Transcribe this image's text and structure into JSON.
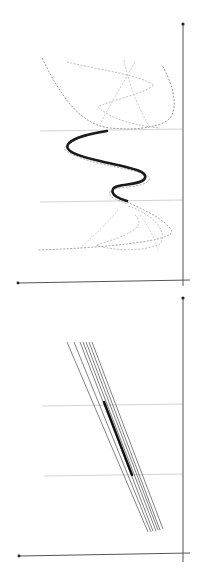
{
  "figure": {
    "background": "#ffffff",
    "panels": [
      {
        "id": "top-panel",
        "axis_color": "#555555",
        "grid_color": "#c8c8c8",
        "vertical_axis": {
          "x": 183,
          "y1": 24,
          "y2": 286
        },
        "horizontal_axis": {
          "x1": 18,
          "y1": 283,
          "x2": 190,
          "y2": 280
        },
        "gridlines": [
          {
            "x1": 40,
            "y1": 131,
            "x2": 183,
            "y2": 129
          },
          {
            "x1": 40,
            "y1": 202,
            "x2": 183,
            "y2": 200
          }
        ],
        "main_curve": {
          "color": "#1a1a1a",
          "width": 2.6,
          "d": "M107,131 C90,134 75,137 69,143 C62,151 78,156 100,161 C125,167 148,170 145,178 C142,186 116,183 113,189 C110,195 120,199 127,201"
        },
        "dashed_curves": [
          {
            "color": "#8a8a8a",
            "d": "M42,58 C60,95 80,125 110,128 C140,131 160,126 168,120 C178,112 176,90 162,65"
          },
          {
            "color": "#b5b5b5",
            "d": "M67,62 C100,70 140,75 154,85 C142,95 110,100 98,107 C110,118 130,125 160,128"
          },
          {
            "color": "#c5c5c5",
            "d": "M124,60 C130,90 140,110 150,128"
          },
          {
            "color": "#c5c5c5",
            "d": "M135,62 C125,80 110,105 100,124"
          },
          {
            "color": "#a0a0a0",
            "d": "M66,146 C60,150 74,157 98,163 C126,170 152,172 149,180 C146,188 112,186 110,192 C108,198 118,200 128,204"
          },
          {
            "color": "#9a9a9a",
            "d": "M127,202 C140,208 168,220 172,232 C168,242 100,248 37,250"
          },
          {
            "color": "#b8b8b8",
            "d": "M128,206 C155,215 168,232 160,244 C140,253 110,250 96,245 C120,238 150,228 135,215"
          },
          {
            "color": "#cccccc",
            "d": "M118,210 C110,220 95,235 80,248"
          },
          {
            "color": "#d0d0d0",
            "d": "M140,215 C150,228 155,240 158,250"
          }
        ]
      },
      {
        "id": "bottom-panel",
        "axis_color": "#555555",
        "grid_color": "#c8c8c8",
        "vertical_axis": {
          "x": 183,
          "y1": 298,
          "y2": 562
        },
        "horizontal_axis": {
          "x1": 19,
          "y1": 556,
          "x2": 190,
          "y2": 553
        },
        "gridlines": [
          {
            "x1": 42,
            "y1": 406,
            "x2": 183,
            "y2": 404
          },
          {
            "x1": 44,
            "y1": 476,
            "x2": 183,
            "y2": 474
          }
        ],
        "line_color": "#4a4a4a",
        "highlight_color": "#111111",
        "lines": [
          {
            "x1": 67,
            "y1": 342,
            "x2": 148,
            "y2": 532
          },
          {
            "x1": 74,
            "y1": 342,
            "x2": 151,
            "y2": 532
          },
          {
            "x1": 80,
            "y1": 342,
            "x2": 153,
            "y2": 531
          },
          {
            "x1": 83,
            "y1": 342,
            "x2": 156,
            "y2": 531
          },
          {
            "x1": 86,
            "y1": 342,
            "x2": 158,
            "y2": 530
          },
          {
            "x1": 89,
            "y1": 342,
            "x2": 160,
            "y2": 530
          },
          {
            "x1": 92,
            "y1": 342,
            "x2": 163,
            "y2": 529
          }
        ],
        "highlight": {
          "x1": 104,
          "y1": 402,
          "x2": 132,
          "y2": 475,
          "width": 2.4
        }
      }
    ]
  }
}
